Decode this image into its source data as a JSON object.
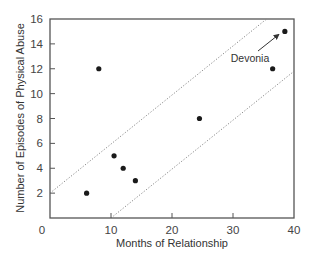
{
  "chart_data": {
    "type": "scatter",
    "title": "",
    "xlabel": "Months of Relationship",
    "ylabel": "Number of Episodes of Physical Abuse",
    "xlim": [
      0,
      40
    ],
    "ylim": [
      0,
      16
    ],
    "x_ticks": [
      0,
      10,
      20,
      30,
      40
    ],
    "y_ticks": [
      2,
      4,
      6,
      8,
      10,
      12,
      14,
      16
    ],
    "grid": false,
    "legend": null,
    "series": [
      {
        "name": "Relationships",
        "points": [
          {
            "x": 6,
            "y": 2
          },
          {
            "x": 8,
            "y": 12
          },
          {
            "x": 10.5,
            "y": 5
          },
          {
            "x": 12,
            "y": 4
          },
          {
            "x": 14,
            "y": 3
          },
          {
            "x": 24.5,
            "y": 8
          },
          {
            "x": 36.5,
            "y": 12
          },
          {
            "x": 38.5,
            "y": 15
          }
        ]
      }
    ],
    "reference_lines": [
      {
        "name": "upper-dotted-band",
        "style": "dotted",
        "x1": 0,
        "y1": 2,
        "x2": 35.5,
        "y2": 16
      },
      {
        "name": "lower-dotted-band",
        "style": "dotted",
        "x1": 10,
        "y1": 0,
        "x2": 40,
        "y2": 11.8
      }
    ],
    "annotations": [
      {
        "text": "Devonia",
        "target": {
          "x": 38.5,
          "y": 15
        },
        "arrow": true
      }
    ]
  }
}
